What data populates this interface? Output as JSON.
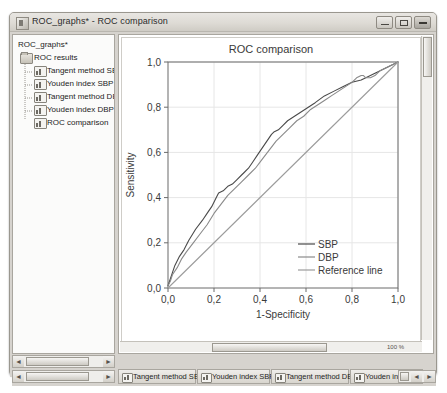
{
  "window": {
    "title": "ROC_graphs* - ROC comparison",
    "app_icon": "app-window-icon",
    "minimize_label": "–",
    "maximize_label": "□",
    "close_label": "✕"
  },
  "sidebar": {
    "root": {
      "label": "ROC_graphs*",
      "icon": "document-root-icon"
    },
    "folder": {
      "label": "ROC results",
      "icon": "folder-icon"
    },
    "items": [
      {
        "label": "Tangent method SBP",
        "icon": "chart-node-icon"
      },
      {
        "label": "Youden index SBP",
        "icon": "chart-node-icon"
      },
      {
        "label": "Tangent method DBP",
        "icon": "chart-node-icon"
      },
      {
        "label": "Youden index DBP",
        "icon": "chart-node-icon"
      },
      {
        "label": "ROC comparison",
        "icon": "chart-node-icon"
      }
    ],
    "scrollbar": {
      "left_arrow": "◄",
      "right_arrow": "►"
    }
  },
  "chart_panel": {
    "vscroll": {
      "present": true
    },
    "hscroll": {
      "present": true
    },
    "zoom_label": "100 %",
    "mini_buttons": [
      "◄",
      "□",
      "▤"
    ]
  },
  "tabs": {
    "nav": {
      "left_arrow": "◄",
      "right_arrow": "►"
    },
    "items": [
      {
        "label": "Tangent method SBP",
        "icon": "chart-node-icon",
        "active": false
      },
      {
        "label": "Youden index SBP",
        "icon": "chart-node-icon",
        "active": false
      },
      {
        "label": "Tangent method DBP",
        "icon": "chart-node-icon",
        "active": false
      },
      {
        "label": "Youden index DBP",
        "icon": "chart-node-icon",
        "active": false
      }
    ],
    "end_nav": {
      "left_arrow": "◄",
      "right_arrow": "►"
    }
  },
  "chart_data": {
    "type": "line",
    "title": "ROC comparison",
    "xlabel": "1-Specificity",
    "ylabel": "Sensitivity",
    "xlim": [
      0,
      1
    ],
    "ylim": [
      0,
      1
    ],
    "grid": true,
    "legend_position": "bottom-right",
    "xticks": [
      0,
      0.2,
      0.4,
      0.6,
      0.8,
      1.0
    ],
    "yticks": [
      0,
      0.2,
      0.4,
      0.6,
      0.8,
      1.0
    ],
    "xticklabels": [
      "0,0",
      "0,2",
      "0,4",
      "0,6",
      "0,8",
      "1,0"
    ],
    "yticklabels": [
      "0,0",
      "0,2",
      "0,4",
      "0,6",
      "0,8",
      "1,0"
    ],
    "colors": {
      "SBP": "#4a4a4a",
      "DBP": "#8a8a8a",
      "Reference line": "#9c9c9c"
    },
    "series": [
      {
        "name": "SBP",
        "color": "#4a4a4a",
        "x": [
          0.0,
          0.01,
          0.02,
          0.03,
          0.05,
          0.07,
          0.09,
          0.12,
          0.15,
          0.17,
          0.19,
          0.21,
          0.22,
          0.24,
          0.26,
          0.28,
          0.3,
          0.32,
          0.33,
          0.35,
          0.37,
          0.39,
          0.41,
          0.43,
          0.45,
          0.46,
          0.48,
          0.5,
          0.52,
          0.55,
          0.58,
          0.61,
          0.64,
          0.68,
          0.72,
          0.76,
          0.8,
          0.84,
          0.86,
          0.88,
          0.9,
          0.92,
          0.94,
          0.96,
          0.98,
          1.0
        ],
        "y": [
          0.01,
          0.04,
          0.07,
          0.1,
          0.14,
          0.17,
          0.21,
          0.26,
          0.3,
          0.33,
          0.36,
          0.4,
          0.42,
          0.43,
          0.45,
          0.46,
          0.48,
          0.5,
          0.51,
          0.53,
          0.56,
          0.59,
          0.62,
          0.65,
          0.68,
          0.69,
          0.7,
          0.72,
          0.74,
          0.76,
          0.78,
          0.8,
          0.82,
          0.85,
          0.87,
          0.89,
          0.91,
          0.92,
          0.93,
          0.94,
          0.95,
          0.96,
          0.97,
          0.98,
          0.99,
          1.0
        ]
      },
      {
        "name": "DBP",
        "color": "#8a8a8a",
        "x": [
          0.0,
          0.01,
          0.02,
          0.04,
          0.06,
          0.08,
          0.11,
          0.14,
          0.17,
          0.2,
          0.23,
          0.26,
          0.29,
          0.32,
          0.35,
          0.38,
          0.41,
          0.44,
          0.47,
          0.5,
          0.53,
          0.56,
          0.59,
          0.62,
          0.65,
          0.68,
          0.71,
          0.74,
          0.77,
          0.8,
          0.82,
          0.84,
          0.85,
          0.86,
          0.88,
          0.9,
          0.92,
          0.94,
          0.96,
          0.98,
          1.0
        ],
        "y": [
          0.01,
          0.03,
          0.06,
          0.09,
          0.13,
          0.16,
          0.2,
          0.24,
          0.28,
          0.33,
          0.37,
          0.41,
          0.44,
          0.47,
          0.5,
          0.53,
          0.57,
          0.61,
          0.65,
          0.68,
          0.71,
          0.74,
          0.76,
          0.79,
          0.81,
          0.83,
          0.85,
          0.87,
          0.89,
          0.91,
          0.93,
          0.94,
          0.94,
          0.93,
          0.93,
          0.94,
          0.96,
          0.97,
          0.98,
          0.99,
          1.0
        ]
      },
      {
        "name": "Reference line",
        "color": "#9c9c9c",
        "x": [
          0.0,
          1.0
        ],
        "y": [
          0.0,
          1.0
        ]
      }
    ]
  }
}
